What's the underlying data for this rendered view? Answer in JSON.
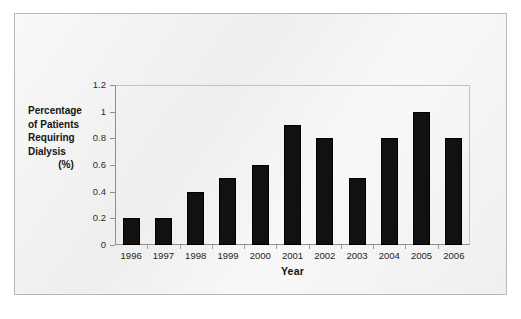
{
  "chart_data": {
    "type": "bar",
    "title": "",
    "xlabel": "Year",
    "ylabel": "Percentage of Patients Requiring Dialysis (%)",
    "ylabel_lines": [
      "Percentage",
      "of Patients",
      "Requiring",
      "Dialysis",
      "(%)"
    ],
    "categories": [
      "1996",
      "1997",
      "1998",
      "1999",
      "2000",
      "2001",
      "2002",
      "2003",
      "2004",
      "2005",
      "2006"
    ],
    "values": [
      0.2,
      0.2,
      0.4,
      0.5,
      0.6,
      0.9,
      0.8,
      0.5,
      0.8,
      1.0,
      0.8
    ],
    "ylim": [
      0,
      1.2
    ],
    "ytick_labels": [
      "0",
      "0.2",
      "0.4",
      "0.6",
      "0.8",
      "1",
      "1.2"
    ],
    "ytick_values": [
      0,
      0.2,
      0.4,
      0.6,
      0.8,
      1,
      1.2
    ],
    "grid": false,
    "legend": false,
    "legend_position": "none",
    "series_color": "#111111",
    "plot_border_color": "#c2c2c2",
    "axis_color": "#8f8f8f",
    "background_color": "#f1f1f1"
  }
}
